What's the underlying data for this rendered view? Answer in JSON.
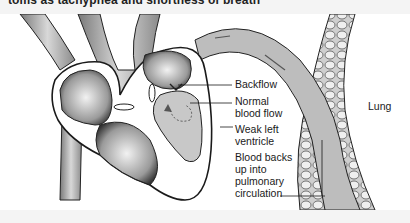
{
  "page": {
    "top_text_fragment": "toms as tachypnea and shortness of breath"
  },
  "figure": {
    "type": "medical-illustration",
    "colors": {
      "ink": "#1a1a1a",
      "shade": "#9a9a9a",
      "background": "#ffffff",
      "page": "#f4f4f4"
    },
    "labels": {
      "backflow": "Backflow",
      "normal_flow_1": "Normal",
      "normal_flow_2": "blood flow",
      "weak_lv_1": "Weak left",
      "weak_lv_2": "ventricle",
      "backs_up_1": "Blood backs",
      "backs_up_2": "up into",
      "backs_up_3": "pulmonary",
      "backs_up_4": "circulation",
      "lung": "Lung"
    }
  }
}
